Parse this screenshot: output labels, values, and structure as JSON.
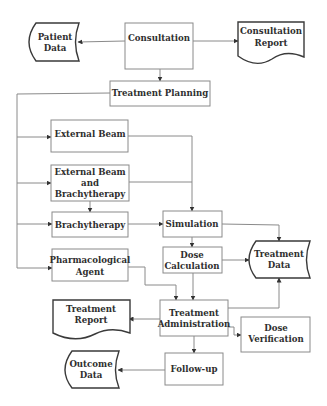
{
  "diagram": {
    "type": "flowchart",
    "nodes": {
      "patient_data": {
        "label_lines": [
          "Patient",
          "Data"
        ],
        "shape": "stored-data"
      },
      "consultation": {
        "label_lines": [
          "Consultation"
        ],
        "shape": "process"
      },
      "consultation_report": {
        "label_lines": [
          "Consultation",
          "Report"
        ],
        "shape": "document"
      },
      "treatment_planning": {
        "label_lines": [
          "Treatment Planning"
        ],
        "shape": "process"
      },
      "external_beam": {
        "label_lines": [
          "External Beam"
        ],
        "shape": "process"
      },
      "external_beam_brachy": {
        "label_lines": [
          "External Beam",
          "and",
          "Brachytherapy"
        ],
        "shape": "process"
      },
      "brachytherapy": {
        "label_lines": [
          "Brachytherapy"
        ],
        "shape": "process"
      },
      "pharmacological_agent": {
        "label_lines": [
          "Pharmacological",
          "Agent"
        ],
        "shape": "process"
      },
      "simulation": {
        "label_lines": [
          "Simulation"
        ],
        "shape": "process"
      },
      "dose_calculation": {
        "label_lines": [
          "Dose",
          "Calculation"
        ],
        "shape": "process"
      },
      "treatment_data": {
        "label_lines": [
          "Treatment",
          "Data"
        ],
        "shape": "stored-data"
      },
      "treatment_report": {
        "label_lines": [
          "Treatment",
          "Report"
        ],
        "shape": "document"
      },
      "treatment_administration": {
        "label_lines": [
          "Treatment",
          "Administration"
        ],
        "shape": "process"
      },
      "dose_verification": {
        "label_lines": [
          "Dose",
          "Verification"
        ],
        "shape": "process"
      },
      "follow_up": {
        "label_lines": [
          "Follow-up"
        ],
        "shape": "process"
      },
      "outcome_data": {
        "label_lines": [
          "Outcome",
          "Data"
        ],
        "shape": "stored-data"
      }
    },
    "edges": [
      {
        "from": "consultation",
        "to": "patient_data"
      },
      {
        "from": "consultation",
        "to": "consultation_report"
      },
      {
        "from": "consultation",
        "to": "treatment_planning"
      },
      {
        "from": "treatment_planning",
        "to": "external_beam"
      },
      {
        "from": "treatment_planning",
        "to": "external_beam_brachy"
      },
      {
        "from": "treatment_planning",
        "to": "brachytherapy"
      },
      {
        "from": "treatment_planning",
        "to": "pharmacological_agent"
      },
      {
        "from": "external_beam",
        "to": "simulation"
      },
      {
        "from": "external_beam_brachy",
        "to": "simulation"
      },
      {
        "from": "external_beam_brachy",
        "to": "brachytherapy"
      },
      {
        "from": "brachytherapy",
        "to": "simulation"
      },
      {
        "from": "simulation",
        "to": "dose_calculation"
      },
      {
        "from": "simulation",
        "to": "treatment_data"
      },
      {
        "from": "dose_calculation",
        "to": "treatment_data"
      },
      {
        "from": "dose_calculation",
        "to": "treatment_administration"
      },
      {
        "from": "pharmacological_agent",
        "to": "treatment_administration"
      },
      {
        "from": "treatment_administration",
        "to": "treatment_data"
      },
      {
        "from": "treatment_administration",
        "to": "treatment_report"
      },
      {
        "from": "treatment_administration",
        "to": "dose_verification"
      },
      {
        "from": "treatment_administration",
        "to": "follow_up"
      },
      {
        "from": "follow_up",
        "to": "outcome_data"
      }
    ]
  },
  "colors": {
    "box_stroke": "#8a8a8a",
    "shape_stroke": "#3a3a3a",
    "text": "#2e2e2e",
    "background": "#ffffff"
  }
}
